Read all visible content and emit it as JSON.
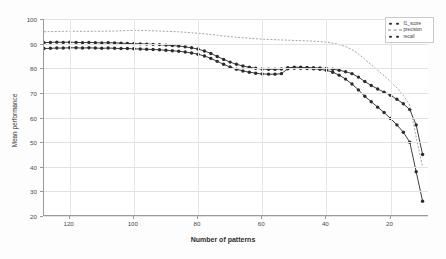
{
  "chart_data": {
    "type": "line",
    "title": "",
    "xlabel": "Number of patterns",
    "ylabel": "Mean performance",
    "xlim": [
      128,
      8
    ],
    "ylim": [
      20,
      100
    ],
    "x_ticks": [
      120,
      100,
      80,
      60,
      40,
      20
    ],
    "y_ticks": [
      20,
      30,
      40,
      50,
      60,
      70,
      80,
      90,
      100
    ],
    "grid": true,
    "x_reversed": true,
    "legend_position": "top-right",
    "legend": [
      "f1_score",
      "precision",
      "recall"
    ],
    "x": [
      128,
      126,
      124,
      122,
      120,
      118,
      116,
      114,
      112,
      110,
      108,
      106,
      104,
      102,
      100,
      98,
      96,
      94,
      92,
      90,
      88,
      86,
      84,
      82,
      80,
      78,
      76,
      74,
      72,
      70,
      68,
      66,
      64,
      62,
      60,
      58,
      56,
      54,
      52,
      50,
      48,
      46,
      44,
      42,
      40,
      38,
      36,
      34,
      32,
      30,
      28,
      26,
      24,
      22,
      20,
      18,
      16,
      14,
      12,
      10
    ],
    "series": [
      {
        "name": "f1_score",
        "style": "markers",
        "color": "#2b2b2b",
        "values": [
          90.4,
          90.5,
          90.6,
          90.5,
          90.6,
          90.5,
          90.4,
          90.5,
          90.4,
          90.3,
          90.4,
          90.3,
          90.2,
          90.1,
          90.0,
          89.9,
          89.8,
          89.7,
          89.6,
          89.4,
          89.2,
          89.0,
          88.7,
          88.3,
          87.8,
          87.0,
          86.0,
          84.8,
          83.6,
          82.5,
          81.6,
          80.9,
          80.4,
          80.0,
          79.7,
          79.6,
          79.6,
          79.7,
          80.2,
          80.4,
          80.4,
          80.3,
          80.2,
          80.1,
          79.9,
          79.6,
          79.2,
          78.6,
          77.8,
          76.4,
          74.6,
          73.0,
          71.6,
          70.3,
          69.0,
          67.4,
          65.6,
          63.2,
          57.0,
          45.0
        ]
      },
      {
        "name": "precision",
        "style": "dashed",
        "color": "#8d8d8d",
        "values": [
          94.8,
          94.9,
          94.9,
          95.0,
          95.0,
          95.0,
          95.0,
          95.0,
          95.0,
          95.0,
          95.1,
          95.1,
          95.2,
          95.3,
          95.4,
          95.4,
          95.3,
          95.2,
          95.1,
          95.0,
          94.9,
          94.8,
          94.6,
          94.4,
          94.2,
          94.0,
          93.7,
          93.4,
          93.1,
          92.8,
          92.6,
          92.4,
          92.2,
          92.0,
          91.8,
          91.7,
          91.6,
          91.5,
          91.4,
          91.3,
          91.2,
          91.1,
          91.0,
          90.8,
          90.6,
          90.2,
          89.6,
          88.8,
          87.6,
          85.8,
          83.6,
          81.4,
          79.2,
          77.0,
          74.6,
          72.0,
          69.0,
          65.0,
          52.0,
          40.0
        ]
      },
      {
        "name": "recall",
        "style": "markers",
        "color": "#2b2b2b",
        "values": [
          88.0,
          88.1,
          88.2,
          88.2,
          88.3,
          88.3,
          88.2,
          88.3,
          88.2,
          88.1,
          88.2,
          88.1,
          88.0,
          88.0,
          87.9,
          87.8,
          87.7,
          87.6,
          87.5,
          87.3,
          87.1,
          86.9,
          86.6,
          86.2,
          85.7,
          85.0,
          84.0,
          82.8,
          81.6,
          80.5,
          79.6,
          78.9,
          78.4,
          78.0,
          77.7,
          77.6,
          77.6,
          77.8,
          79.8,
          80.0,
          80.0,
          79.9,
          79.8,
          79.6,
          79.2,
          78.4,
          77.2,
          75.6,
          73.6,
          71.2,
          68.6,
          66.4,
          64.2,
          62.0,
          59.6,
          57.0,
          54.0,
          50.0,
          38.0,
          26.0
        ]
      }
    ]
  }
}
